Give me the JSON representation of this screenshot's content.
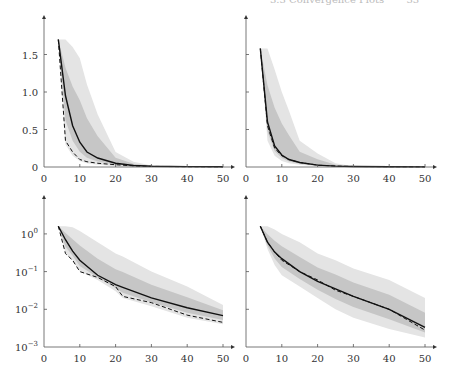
{
  "header": {
    "text": "3.3 Convergence Plots",
    "page": "33"
  },
  "chart_data": [
    {
      "type": "line",
      "title": "",
      "position": "top-left",
      "xlabel": "",
      "ylabel": "",
      "xlim": [
        0,
        50
      ],
      "ylim": [
        0,
        1.8
      ],
      "xticks": [
        "0",
        "10",
        "20",
        "30",
        "40",
        "50"
      ],
      "yticks": [
        "0",
        "0.5",
        "1.0",
        "1.5"
      ],
      "x": [
        4,
        6,
        8,
        10,
        12,
        15,
        20,
        25,
        30,
        40,
        50
      ],
      "series": [
        {
          "name": "mean",
          "style": "solid",
          "values": [
            1.7,
            0.95,
            0.55,
            0.33,
            0.2,
            0.12,
            0.05,
            0.02,
            0.01,
            0.005,
            0.003
          ]
        },
        {
          "name": "best",
          "style": "dashed",
          "values": [
            1.7,
            0.35,
            0.2,
            0.1,
            0.07,
            0.05,
            0.03,
            0.015,
            0.008,
            0.004,
            0.003
          ]
        },
        {
          "name": "band-upper",
          "style": "fill",
          "values": [
            1.7,
            1.7,
            1.6,
            1.45,
            1.1,
            0.7,
            0.2,
            0.07,
            0.02,
            0.008,
            0.005
          ]
        },
        {
          "name": "band-lower",
          "style": "fill",
          "values": [
            1.7,
            0.3,
            0.15,
            0.08,
            0.05,
            0.03,
            0.01,
            0.005,
            0.003,
            0.002,
            0.001
          ]
        }
      ]
    },
    {
      "type": "line",
      "title": "",
      "position": "top-right",
      "xlim": [
        0,
        50
      ],
      "ylim": [
        0,
        1.8
      ],
      "xticks": [
        "0",
        "10",
        "20",
        "30",
        "40",
        "50"
      ],
      "yticks": [
        "0",
        "0.5",
        "1.0",
        "1.5"
      ],
      "x": [
        4,
        6,
        8,
        10,
        12,
        15,
        20,
        25,
        30,
        40,
        50
      ],
      "series": [
        {
          "name": "mean",
          "style": "solid",
          "values": [
            1.58,
            0.6,
            0.28,
            0.16,
            0.1,
            0.06,
            0.025,
            0.012,
            0.007,
            0.004,
            0.002
          ]
        },
        {
          "name": "best",
          "style": "dashed",
          "values": [
            1.58,
            0.55,
            0.25,
            0.15,
            0.1,
            0.06,
            0.025,
            0.012,
            0.007,
            0.004,
            0.002
          ]
        },
        {
          "name": "band-upper",
          "style": "fill",
          "values": [
            1.58,
            1.58,
            1.3,
            1.0,
            0.75,
            0.35,
            0.18,
            0.05,
            0.01,
            0.005,
            0.003
          ]
        },
        {
          "name": "band-lower",
          "style": "fill",
          "values": [
            1.58,
            0.35,
            0.15,
            0.08,
            0.05,
            0.03,
            0.01,
            0.005,
            0.002,
            0.001,
            0.001
          ]
        }
      ]
    },
    {
      "type": "line",
      "title": "",
      "position": "bottom-left",
      "yscale": "log",
      "xlim": [
        0,
        50
      ],
      "ylim": [
        0.001,
        10
      ],
      "xticks": [
        "0",
        "10",
        "20",
        "30",
        "40",
        "50"
      ],
      "yticks": [
        "10^-3",
        "10^-2",
        "10^-1",
        "10^0"
      ],
      "x": [
        4,
        6,
        8,
        10,
        15,
        20,
        22,
        30,
        40,
        50
      ],
      "series": [
        {
          "name": "mean",
          "style": "solid",
          "values": [
            1.6,
            0.7,
            0.35,
            0.2,
            0.08,
            0.045,
            0.038,
            0.02,
            0.011,
            0.0068
          ]
        },
        {
          "name": "best",
          "style": "dashed",
          "values": [
            1.6,
            0.3,
            0.2,
            0.1,
            0.07,
            0.04,
            0.022,
            0.015,
            0.007,
            0.0045
          ]
        },
        {
          "name": "band-upper",
          "style": "fill",
          "values": [
            1.6,
            1.6,
            1.5,
            1.2,
            0.6,
            0.3,
            0.25,
            0.1,
            0.04,
            0.013
          ]
        },
        {
          "name": "band-lower",
          "style": "fill",
          "values": [
            1.6,
            0.3,
            0.2,
            0.1,
            0.06,
            0.03,
            0.02,
            0.012,
            0.006,
            0.004
          ]
        }
      ]
    },
    {
      "type": "line",
      "title": "",
      "position": "bottom-right",
      "yscale": "log",
      "xlim": [
        0,
        50
      ],
      "ylim": [
        0.001,
        10
      ],
      "xticks": [
        "0",
        "10",
        "20",
        "30",
        "40",
        "50"
      ],
      "yticks": [
        "10^-3",
        "10^-2",
        "10^-1",
        "10^0"
      ],
      "x": [
        4,
        6,
        8,
        10,
        15,
        20,
        25,
        30,
        40,
        50
      ],
      "series": [
        {
          "name": "mean",
          "style": "solid",
          "values": [
            1.6,
            0.6,
            0.33,
            0.22,
            0.1,
            0.055,
            0.035,
            0.022,
            0.01,
            0.0033
          ]
        },
        {
          "name": "best",
          "style": "dashed",
          "values": [
            1.6,
            0.6,
            0.33,
            0.2,
            0.1,
            0.06,
            0.032,
            0.022,
            0.01,
            0.0028
          ]
        },
        {
          "name": "band-upper",
          "style": "fill",
          "values": [
            1.6,
            1.6,
            1.3,
            1.0,
            0.6,
            0.3,
            0.2,
            0.12,
            0.06,
            0.02
          ]
        },
        {
          "name": "band-lower",
          "style": "fill",
          "values": [
            1.6,
            0.4,
            0.15,
            0.08,
            0.04,
            0.02,
            0.01,
            0.006,
            0.003,
            0.0018
          ]
        }
      ]
    }
  ]
}
